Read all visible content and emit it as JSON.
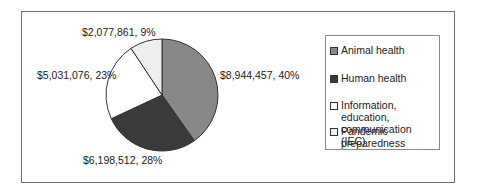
{
  "chart_data": {
    "type": "pie",
    "title": "",
    "categories": [
      "Animal health",
      "Human health",
      "Information, education, communication (IEC)",
      "Pandemic preparedness"
    ],
    "values": [
      8944457,
      6198512,
      5031076,
      2077861
    ],
    "percentages": [
      40,
      28,
      23,
      9
    ],
    "data_labels": [
      "$8,944,457, 40%",
      "$6,198,512, 28%",
      "$5,031,076, 23%",
      "$2,077,861, 9%"
    ],
    "colors": [
      "#888888",
      "#3a3a3a",
      "#ffffff",
      "#eeeeee"
    ],
    "legend_position": "right",
    "start_angle": "12 o'clock",
    "direction": "clockwise"
  },
  "labels": {
    "animal": "$8,944,457, 40%",
    "human": "$6,198,512, 28%",
    "iec": "$5,031,076, 23%",
    "pandemic": "$2,077,861, 9%"
  },
  "legend": {
    "items": [
      {
        "label": "Animal health",
        "color": "#888888"
      },
      {
        "label": "Human health",
        "color": "#3a3a3a"
      },
      {
        "label_line1": "Information, education,",
        "label_line2": "communication (IEC)",
        "color": "#ffffff"
      },
      {
        "label": "Pandemic preparedness",
        "color": "#eeeeee"
      }
    ]
  }
}
